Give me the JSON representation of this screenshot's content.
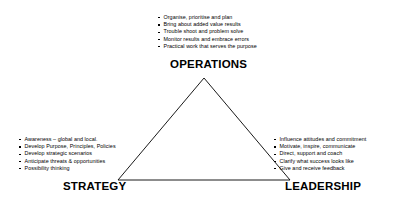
{
  "diagram": {
    "title_visible": false,
    "shape": "triangle",
    "line_color": "#000000",
    "background_color": "#ffffff",
    "text_color": "#000000",
    "vertices": [
      {
        "id": "operations",
        "label": "OPERATIONS",
        "position": "top",
        "bullets": [
          "Organise, prioritise and plan",
          "Bring about added value results",
          "Trouble shoot and problem solve",
          "Monitor results and embrace errors",
          "Practical work that serves the purpose"
        ]
      },
      {
        "id": "strategy",
        "label": "STRATEGY",
        "position": "bottom-left",
        "bullets": [
          "Awareness – global and local.",
          "Develop Purpose, Principles, Policies",
          "Develop strategic scenarios",
          "Anticipate threats & opportunities",
          "Possibility  thinking"
        ]
      },
      {
        "id": "leadership",
        "label": "LEADERSHIP",
        "position": "bottom-right",
        "bullets": [
          "Influence attitudes and commitment",
          "Motivate, inspire, communicate",
          "Direct, support and coach",
          "Clarify what success looks like",
          "Give and receive feedback"
        ]
      }
    ]
  }
}
